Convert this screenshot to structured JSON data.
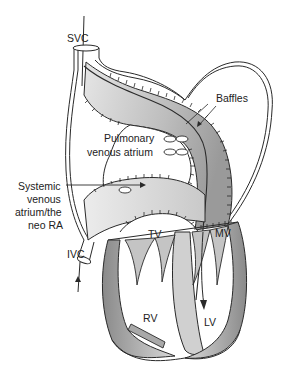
{
  "diagram": {
    "type": "anatomical-illustration",
    "labels": {
      "svc": "SVC",
      "baffles": "Baffles",
      "pulmonary_venous_atrium_line1": "Pulmonary",
      "pulmonary_venous_atrium_line2": "venous atrium",
      "systemic_line1": "Systemic",
      "systemic_line2": "venous",
      "systemic_line3": "atrium/the",
      "systemic_line4": "neo RA",
      "ivc": "IVC",
      "tv": "TV",
      "mv": "MV",
      "rv": "RV",
      "lv": "LV"
    },
    "colors": {
      "outline": "#2a2a2a",
      "baffle_light": "#d9d9d9",
      "baffle_dark": "#a8a8a8",
      "wall_light": "#e2e2e2",
      "wall_dark": "#8f8f8f",
      "background": "#ffffff"
    }
  }
}
